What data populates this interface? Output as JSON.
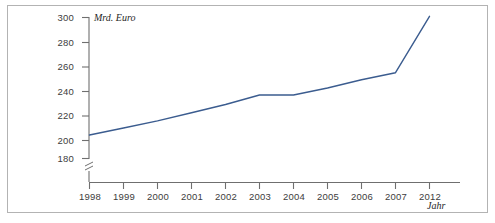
{
  "figure": {
    "border_color": "#b3b3b3",
    "background": "#ffffff",
    "y_axis_caption": "Mrd. Euro",
    "x_axis_caption": "Jahr"
  },
  "chart_data": {
    "type": "line",
    "title": "",
    "subtitle": "",
    "xlabel": "Jahr",
    "ylabel": "Mrd. Euro",
    "categories": [
      "1998",
      "1999",
      "2000",
      "2001",
      "2002",
      "2003",
      "2004",
      "2005",
      "2006",
      "2007",
      "2012"
    ],
    "x_tick_labels": [
      "1998",
      "1999",
      "2000",
      "2001",
      "2002",
      "2003",
      "2004",
      "2005",
      "2006",
      "2007",
      "2012"
    ],
    "y_tick_labels": [
      "180",
      "200",
      "220",
      "240",
      "260",
      "280",
      "300"
    ],
    "y_ticks": [
      180,
      200,
      220,
      240,
      260,
      280,
      300
    ],
    "ylim": [
      172,
      303
    ],
    "y_axis_break": true,
    "x_axis_break_note": "axis jumps from 2007 to 2012",
    "grid": false,
    "legend": false,
    "legend_position": "none",
    "line_color": "#3b5c8f",
    "line_width": 1.4,
    "series": [
      {
        "name": "Mrd. Euro",
        "values": [
          200,
          206,
          212,
          219,
          226,
          234,
          234,
          240,
          247,
          253,
          301
        ]
      }
    ]
  }
}
